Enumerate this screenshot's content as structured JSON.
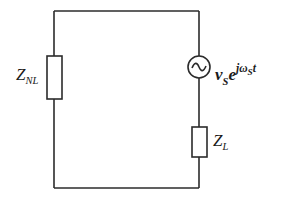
{
  "diagram": {
    "type": "circuit",
    "components": [
      {
        "id": "nonlinear-load",
        "kind": "impedance",
        "label_main": "Z",
        "label_sub": "NL",
        "position": "left branch"
      },
      {
        "id": "source",
        "kind": "ac-voltage-source",
        "label_main": "v",
        "label_sub": "S",
        "label_base": "e",
        "label_exp_main": "jω",
        "label_exp_sub": "S",
        "label_exp_tail": "t",
        "position": "right branch, top"
      },
      {
        "id": "load",
        "kind": "impedance",
        "label_main": "Z",
        "label_sub": "L",
        "position": "right branch, bottom"
      }
    ],
    "connections": "single series loop: Z_NL (left) — source and Z_L in series (right)",
    "colors": {
      "stroke": "#2b2b2b",
      "background": "#ffffff"
    }
  }
}
